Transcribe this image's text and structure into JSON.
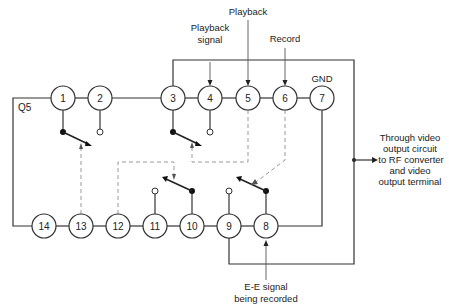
{
  "diagram": {
    "chip_label": "Q5",
    "top_pins": [
      "1",
      "2",
      "3",
      "4",
      "5",
      "6",
      "7"
    ],
    "bottom_pins": [
      "14",
      "13",
      "12",
      "11",
      "10",
      "9",
      "8"
    ],
    "labels": {
      "playback_signal_line1": "Playback",
      "playback_signal_line2": "signal",
      "playback": "Playback",
      "record": "Record",
      "gnd": "GND",
      "output_line1": "Through video",
      "output_line2": "output circuit",
      "output_line3": "to RF converter",
      "output_line4": "and video",
      "output_line5": "output terminal",
      "ee_line1": "E-E signal",
      "ee_line2": "being recorded"
    },
    "colors": {
      "line": "#333333",
      "dashed_control": "#999999",
      "background": "#ffffff"
    }
  }
}
